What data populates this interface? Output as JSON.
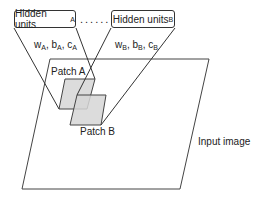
{
  "diagram": {
    "hidden_units_a": {
      "text": "Hidden units",
      "subscript": "A"
    },
    "hidden_units_b": {
      "text": "Hidden units",
      "subscript": "B"
    },
    "ellipsis": "......",
    "params_a": {
      "w": "w",
      "b": "b",
      "c": "c",
      "subscript": "A"
    },
    "params_b": {
      "w": "w",
      "b": "b",
      "c": "c",
      "subscript": "B"
    },
    "patch_a": "Patch A",
    "patch_b": "Patch B",
    "input_image": "Input image"
  },
  "colors": {
    "line": "#333333",
    "patch_fill": "#d9d9d9",
    "patch_overlap": "#c4c4c4"
  }
}
